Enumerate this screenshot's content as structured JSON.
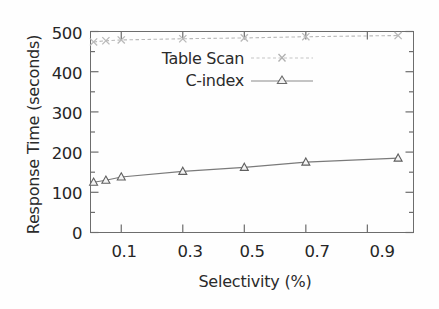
{
  "chart_data": {
    "type": "line",
    "title": "",
    "xlabel": "Selectivity (%)",
    "ylabel": "Response Time (seconds)",
    "xlim": [
      0,
      1.05
    ],
    "ylim": [
      0,
      500
    ],
    "xticks": [
      "0.1",
      "0.3",
      "0.5",
      "0.7",
      "0.9"
    ],
    "xtick_values": [
      0.1,
      0.3,
      0.5,
      0.7,
      0.9
    ],
    "yticks": [
      "0",
      "100",
      "200",
      "300",
      "400",
      "500"
    ],
    "ytick_values": [
      0,
      100,
      200,
      300,
      400,
      500
    ],
    "minor_ticks": true,
    "grid": false,
    "legend_position": "upper left",
    "x": [
      0.01,
      0.05,
      0.1,
      0.3,
      0.5,
      0.7,
      1.0
    ],
    "series": [
      {
        "name": "Table Scan",
        "marker": "x",
        "color": "#b9b9b9",
        "values": [
          474,
          477,
          479,
          482,
          484,
          487,
          490
        ]
      },
      {
        "name": "C-index",
        "marker": "triangle",
        "color": "#7a7a7a",
        "values": [
          125,
          130,
          138,
          152,
          162,
          175,
          185
        ]
      }
    ]
  },
  "legend": {
    "entries": [
      {
        "label": "Table Scan"
      },
      {
        "label": "C-index"
      }
    ]
  },
  "colors": {
    "axis": "#6d6d6d",
    "text": "#262626",
    "table_scan": "#b9b9b9",
    "c_index": "#7a7a7a",
    "background": "#fefefe"
  }
}
